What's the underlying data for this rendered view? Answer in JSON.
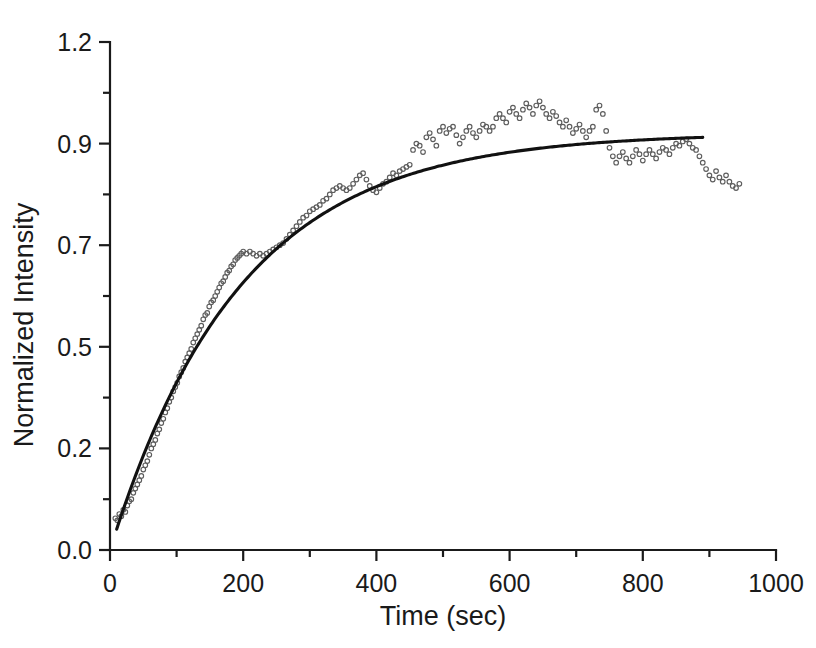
{
  "chart_data": {
    "type": "scatter",
    "title": "",
    "subtitle": "",
    "xlabel": "Time (sec)",
    "ylabel": "Normalized Intensity",
    "xlim": [
      0,
      1000
    ],
    "ylim": [
      0.0,
      1.2
    ],
    "grid": false,
    "legend": null,
    "annotations": [],
    "x_ticks": [
      0,
      200,
      400,
      600,
      800,
      1000
    ],
    "x_tick_labels": [
      "0",
      "200",
      "400",
      "600",
      "800",
      "1000"
    ],
    "x_minor_ticks": [
      100,
      300,
      500,
      700,
      900
    ],
    "y_ticks": [
      0.0,
      0.24,
      0.48,
      0.72,
      0.96,
      1.2
    ],
    "y_tick_labels": [
      "0.0",
      "0.2",
      "0.5",
      "0.7",
      "0.9",
      "1.2"
    ],
    "y_minor_ticks": [
      0.12,
      0.36,
      0.6,
      0.84,
      1.08
    ],
    "series": [
      {
        "name": "data",
        "type": "scatter",
        "marker": "open-circle",
        "marker_size": 4.6,
        "color": "#5d5d5d",
        "points": [
          [
            8,
            0.075
          ],
          [
            11,
            0.07
          ],
          [
            14,
            0.085
          ],
          [
            17,
            0.08
          ],
          [
            20,
            0.095
          ],
          [
            23,
            0.09
          ],
          [
            26,
            0.105
          ],
          [
            29,
            0.115
          ],
          [
            32,
            0.12
          ],
          [
            35,
            0.135
          ],
          [
            38,
            0.145
          ],
          [
            41,
            0.155
          ],
          [
            44,
            0.165
          ],
          [
            47,
            0.175
          ],
          [
            50,
            0.19
          ],
          [
            53,
            0.2
          ],
          [
            56,
            0.21
          ],
          [
            59,
            0.225
          ],
          [
            62,
            0.24
          ],
          [
            65,
            0.25
          ],
          [
            68,
            0.26
          ],
          [
            71,
            0.275
          ],
          [
            74,
            0.285
          ],
          [
            77,
            0.3
          ],
          [
            80,
            0.31
          ],
          [
            83,
            0.325
          ],
          [
            86,
            0.335
          ],
          [
            89,
            0.35
          ],
          [
            92,
            0.36
          ],
          [
            95,
            0.375
          ],
          [
            98,
            0.385
          ],
          [
            101,
            0.395
          ],
          [
            104,
            0.41
          ],
          [
            107,
            0.42
          ],
          [
            110,
            0.43
          ],
          [
            113,
            0.445
          ],
          [
            116,
            0.455
          ],
          [
            119,
            0.465
          ],
          [
            122,
            0.475
          ],
          [
            125,
            0.49
          ],
          [
            128,
            0.5
          ],
          [
            131,
            0.51
          ],
          [
            134,
            0.52
          ],
          [
            137,
            0.53
          ],
          [
            140,
            0.545
          ],
          [
            143,
            0.555
          ],
          [
            146,
            0.56
          ],
          [
            149,
            0.575
          ],
          [
            152,
            0.585
          ],
          [
            155,
            0.59
          ],
          [
            158,
            0.6
          ],
          [
            161,
            0.61
          ],
          [
            164,
            0.62
          ],
          [
            167,
            0.63
          ],
          [
            170,
            0.635
          ],
          [
            173,
            0.645
          ],
          [
            176,
            0.655
          ],
          [
            179,
            0.66
          ],
          [
            182,
            0.67
          ],
          [
            185,
            0.675
          ],
          [
            188,
            0.685
          ],
          [
            191,
            0.69
          ],
          [
            194,
            0.695
          ],
          [
            197,
            0.7
          ],
          [
            200,
            0.705
          ],
          [
            205,
            0.7
          ],
          [
            210,
            0.705
          ],
          [
            215,
            0.7
          ],
          [
            220,
            0.695
          ],
          [
            225,
            0.7
          ],
          [
            230,
            0.695
          ],
          [
            235,
            0.7
          ],
          [
            240,
            0.705
          ],
          [
            245,
            0.71
          ],
          [
            250,
            0.715
          ],
          [
            255,
            0.72
          ],
          [
            260,
            0.725
          ],
          [
            265,
            0.735
          ],
          [
            270,
            0.745
          ],
          [
            275,
            0.755
          ],
          [
            280,
            0.765
          ],
          [
            285,
            0.775
          ],
          [
            290,
            0.785
          ],
          [
            295,
            0.79
          ],
          [
            300,
            0.8
          ],
          [
            305,
            0.805
          ],
          [
            310,
            0.81
          ],
          [
            315,
            0.815
          ],
          [
            320,
            0.825
          ],
          [
            325,
            0.83
          ],
          [
            330,
            0.84
          ],
          [
            335,
            0.85
          ],
          [
            340,
            0.855
          ],
          [
            345,
            0.86
          ],
          [
            350,
            0.855
          ],
          [
            355,
            0.85
          ],
          [
            360,
            0.855
          ],
          [
            365,
            0.865
          ],
          [
            370,
            0.875
          ],
          [
            375,
            0.885
          ],
          [
            380,
            0.89
          ],
          [
            385,
            0.875
          ],
          [
            390,
            0.86
          ],
          [
            395,
            0.85
          ],
          [
            400,
            0.845
          ],
          [
            405,
            0.855
          ],
          [
            410,
            0.865
          ],
          [
            415,
            0.87
          ],
          [
            420,
            0.88
          ],
          [
            425,
            0.89
          ],
          [
            430,
            0.885
          ],
          [
            435,
            0.895
          ],
          [
            440,
            0.9
          ],
          [
            445,
            0.905
          ],
          [
            450,
            0.91
          ],
          [
            455,
            0.945
          ],
          [
            460,
            0.96
          ],
          [
            465,
            0.955
          ],
          [
            470,
            0.94
          ],
          [
            475,
            0.975
          ],
          [
            480,
            0.985
          ],
          [
            485,
            0.97
          ],
          [
            490,
            0.955
          ],
          [
            495,
            0.99
          ],
          [
            500,
            1.0
          ],
          [
            505,
            0.985
          ],
          [
            510,
            0.995
          ],
          [
            515,
            1.0
          ],
          [
            520,
            0.98
          ],
          [
            525,
            0.96
          ],
          [
            530,
            0.975
          ],
          [
            535,
            0.99
          ],
          [
            540,
            1.0
          ],
          [
            545,
            0.985
          ],
          [
            550,
            0.975
          ],
          [
            555,
            0.99
          ],
          [
            560,
            1.005
          ],
          [
            565,
            1.0
          ],
          [
            570,
            0.99
          ],
          [
            575,
            1.0
          ],
          [
            580,
            1.02
          ],
          [
            585,
            1.03
          ],
          [
            590,
            1.02
          ],
          [
            595,
            1.01
          ],
          [
            600,
            1.035
          ],
          [
            605,
            1.045
          ],
          [
            610,
            1.03
          ],
          [
            615,
            1.02
          ],
          [
            620,
            1.04
          ],
          [
            625,
            1.055
          ],
          [
            630,
            1.045
          ],
          [
            635,
            1.03
          ],
          [
            640,
            1.05
          ],
          [
            645,
            1.06
          ],
          [
            650,
            1.045
          ],
          [
            655,
            1.03
          ],
          [
            660,
            1.02
          ],
          [
            665,
            1.035
          ],
          [
            670,
            1.025
          ],
          [
            675,
            1.01
          ],
          [
            680,
            1.0
          ],
          [
            685,
            1.015
          ],
          [
            690,
            1.0
          ],
          [
            695,
            0.985
          ],
          [
            700,
            0.995
          ],
          [
            705,
            1.005
          ],
          [
            710,
            0.99
          ],
          [
            715,
            0.975
          ],
          [
            720,
            0.99
          ],
          [
            725,
            1.0
          ],
          [
            730,
            1.04
          ],
          [
            735,
            1.05
          ],
          [
            740,
            1.03
          ],
          [
            745,
            0.99
          ],
          [
            750,
            0.95
          ],
          [
            755,
            0.93
          ],
          [
            760,
            0.915
          ],
          [
            765,
            0.93
          ],
          [
            770,
            0.94
          ],
          [
            775,
            0.925
          ],
          [
            780,
            0.915
          ],
          [
            785,
            0.93
          ],
          [
            790,
            0.945
          ],
          [
            795,
            0.935
          ],
          [
            800,
            0.92
          ],
          [
            805,
            0.935
          ],
          [
            810,
            0.945
          ],
          [
            815,
            0.935
          ],
          [
            820,
            0.925
          ],
          [
            825,
            0.94
          ],
          [
            830,
            0.95
          ],
          [
            835,
            0.945
          ],
          [
            840,
            0.935
          ],
          [
            845,
            0.95
          ],
          [
            850,
            0.96
          ],
          [
            855,
            0.955
          ],
          [
            860,
            0.965
          ],
          [
            865,
            0.97
          ],
          [
            870,
            0.96
          ],
          [
            875,
            0.95
          ],
          [
            880,
            0.945
          ],
          [
            885,
            0.93
          ],
          [
            890,
            0.915
          ],
          [
            895,
            0.9
          ],
          [
            900,
            0.885
          ],
          [
            905,
            0.875
          ],
          [
            910,
            0.895
          ],
          [
            915,
            0.88
          ],
          [
            920,
            0.87
          ],
          [
            925,
            0.885
          ],
          [
            930,
            0.87
          ],
          [
            935,
            0.86
          ],
          [
            940,
            0.855
          ],
          [
            945,
            0.865
          ]
        ]
      },
      {
        "name": "exponential-fit",
        "type": "line",
        "color": "#111111",
        "model": "y = A*(1 - exp(-t/tau))",
        "A": 0.985,
        "tau": 195,
        "t_start": 10,
        "t_end": 890,
        "points": [
          [
            10,
            0.049
          ],
          [
            30,
            0.141
          ],
          [
            50,
            0.226
          ],
          [
            70,
            0.303
          ],
          [
            90,
            0.374
          ],
          [
            110,
            0.438
          ],
          [
            130,
            0.497
          ],
          [
            150,
            0.551
          ],
          [
            170,
            0.6
          ],
          [
            190,
            0.644
          ],
          [
            210,
            0.685
          ],
          [
            230,
            0.722
          ],
          [
            250,
            0.756
          ],
          [
            270,
            0.786
          ],
          [
            290,
            0.814
          ],
          [
            310,
            0.84
          ],
          [
            330,
            0.863
          ],
          [
            350,
            0.884
          ],
          [
            370,
            0.903
          ],
          [
            390,
            0.92
          ],
          [
            410,
            0.936
          ],
          [
            430,
            0.95
          ],
          [
            450,
            0.963
          ],
          [
            470,
            0.975
          ],
          [
            490,
            0.985
          ],
          [
            510,
            0.995
          ],
          [
            530,
            1.004
          ],
          [
            550,
            1.011
          ],
          [
            570,
            1.019
          ],
          [
            590,
            1.025
          ],
          [
            610,
            1.031
          ],
          [
            630,
            1.036
          ],
          [
            650,
            1.041
          ],
          [
            670,
            1.045
          ],
          [
            690,
            1.049
          ],
          [
            710,
            1.053
          ],
          [
            730,
            1.056
          ],
          [
            750,
            1.059
          ],
          [
            770,
            1.061
          ],
          [
            790,
            1.064
          ],
          [
            810,
            1.066
          ],
          [
            830,
            1.067
          ],
          [
            850,
            1.069
          ],
          [
            870,
            1.07
          ],
          [
            890,
            1.072
          ]
        ]
      }
    ]
  },
  "axes": {
    "y_title": "Normalized Intensity",
    "x_title": "Time (sec)"
  }
}
